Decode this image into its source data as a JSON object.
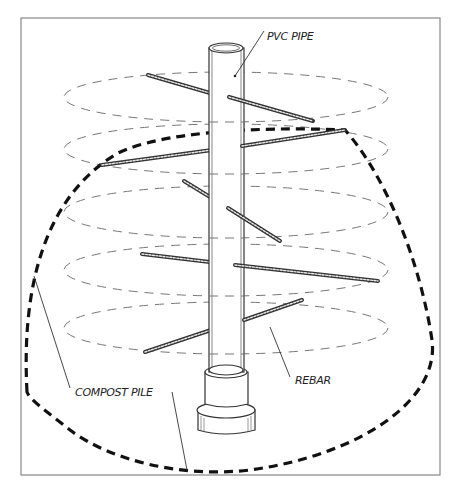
{
  "diagram": {
    "type": "illustration",
    "labels": {
      "pvc_pipe": "PVC PIPE",
      "rebar": "REBAR",
      "compost_pile": "COMPOST PILE"
    },
    "colors": {
      "frame": "#888888",
      "ink": "#222222",
      "ellipse_dash": "#777777",
      "pile_outline": "#111111",
      "background": "#ffffff"
    },
    "layers": [
      {
        "name": "layer-1",
        "y": 97
      },
      {
        "name": "layer-2",
        "y": 150
      },
      {
        "name": "layer-3",
        "y": 212
      },
      {
        "name": "layer-4",
        "y": 270
      },
      {
        "name": "layer-5",
        "y": 328
      }
    ]
  }
}
